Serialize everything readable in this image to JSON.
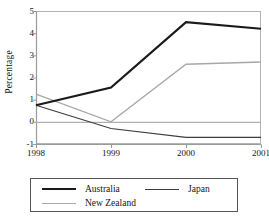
{
  "chart_data": {
    "type": "line",
    "title": "",
    "xlabel": "",
    "ylabel": "Percentage",
    "categories": [
      "1998",
      "1999",
      "2000",
      "2001"
    ],
    "x": [
      1998,
      1999,
      2000,
      2001
    ],
    "xlim": [
      1998,
      2001
    ],
    "ylim": [
      -1,
      5
    ],
    "yticks": [
      5,
      4,
      3,
      2,
      1,
      0,
      -1
    ],
    "ytick_labels": [
      "5",
      "4",
      "3",
      "2",
      "1",
      "0",
      "-1"
    ],
    "grid": false,
    "zero_line": true,
    "legend_position": "bottom",
    "series": [
      {
        "name": "Australia",
        "values": [
          0.75,
          1.55,
          4.5,
          4.2
        ],
        "color": "#1a1a1a",
        "width": 2.2
      },
      {
        "name": "Japan",
        "values": [
          0.75,
          -0.3,
          -0.7,
          -0.7
        ],
        "color": "#3d3d3d",
        "width": 1.2
      },
      {
        "name": "New Zealand",
        "values": [
          1.25,
          0.0,
          2.6,
          2.7
        ],
        "color": "#a8a8a8",
        "width": 1.4
      }
    ]
  },
  "axis": {
    "y_title": "Percentage",
    "y_labels": [
      "5",
      "4",
      "3",
      "2",
      "1",
      "0",
      "-1"
    ],
    "x_labels": [
      "1998",
      "1999",
      "2000",
      "2001"
    ]
  },
  "legend": {
    "items": [
      {
        "label": "Australia",
        "color": "#1a1a1a",
        "width": "2.2px"
      },
      {
        "label": "Japan",
        "color": "#3d3d3d",
        "width": "1.4px"
      },
      {
        "label": "New Zealand",
        "color": "#a8a8a8",
        "width": "1.6px"
      }
    ]
  },
  "colors": {
    "axis_line": "#9b9b9b",
    "frame": "#b4b4b4",
    "zero_line": "#b0b0b0",
    "text": "#141414",
    "legend_border": "#555555"
  }
}
